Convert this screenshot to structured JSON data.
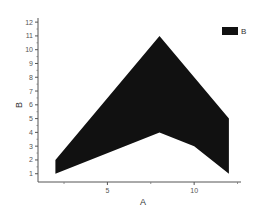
{
  "chart_data": {
    "type": "area",
    "title": "",
    "xlabel": "A",
    "ylabel": "B",
    "xlim": [
      1,
      12.7
    ],
    "ylim": [
      0.4,
      12.3
    ],
    "grid": false,
    "legend_position": "top-right",
    "x_major_ticks": [
      5,
      10
    ],
    "x_minor_ticks": [
      2.5,
      7.5,
      12.5
    ],
    "y_major_ticks": [
      1,
      2,
      3,
      4,
      5,
      6,
      7,
      8,
      9,
      10,
      11,
      12
    ],
    "series": [
      {
        "name": "B",
        "color": "#111111",
        "fill_between": true,
        "upper": {
          "x": [
            2,
            8,
            12
          ],
          "y": [
            2,
            11,
            5
          ]
        },
        "lower": {
          "x": [
            2,
            8,
            10,
            12
          ],
          "y": [
            1,
            4,
            3,
            1
          ]
        }
      }
    ],
    "legend": [
      {
        "label": "B",
        "color": "#111111"
      }
    ]
  }
}
